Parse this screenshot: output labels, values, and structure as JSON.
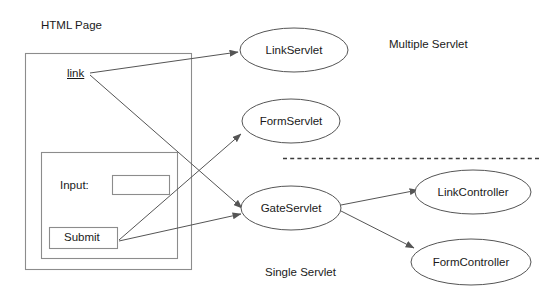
{
  "diagram": {
    "title_label": "HTML Page",
    "section_labels": {
      "multiple": "Multiple Servlet",
      "single": "Single Servlet"
    },
    "html_page": {
      "link_label": "link",
      "form": {
        "input_label": "Input:",
        "input_value": "",
        "submit_label": "Submit"
      }
    },
    "nodes": [
      {
        "id": "link-servlet",
        "label": "LinkServlet"
      },
      {
        "id": "form-servlet",
        "label": "FormServlet"
      },
      {
        "id": "gate-servlet",
        "label": "GateServlet"
      },
      {
        "id": "link-controller",
        "label": "LinkController"
      },
      {
        "id": "form-controller",
        "label": "FormController"
      }
    ],
    "colors": {
      "stroke": "#555555",
      "box_stroke": "#8c8c8c",
      "text": "#1a1a1a",
      "divider": "#3c3c3c",
      "background": "#ffffff"
    }
  }
}
